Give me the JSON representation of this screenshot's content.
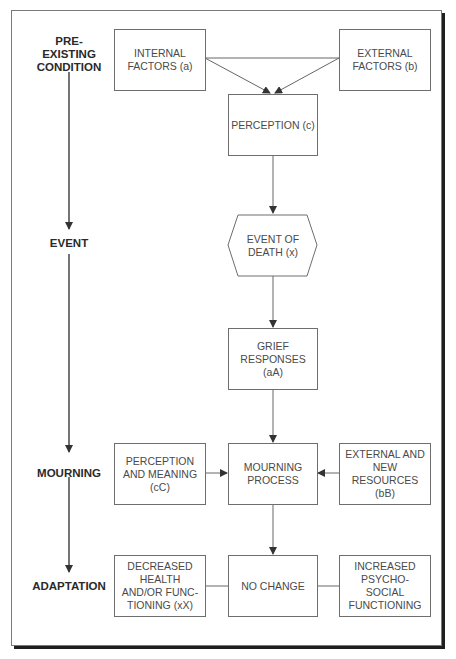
{
  "stages": [
    {
      "id": "pre-existing-condition",
      "label": "PRE-\nEXISTING\nCONDITION"
    },
    {
      "id": "event",
      "label": "EVENT"
    },
    {
      "id": "mourning",
      "label": "MOURNING"
    },
    {
      "id": "adaptation",
      "label": "ADAPTATION"
    }
  ],
  "nodes": {
    "internal_factors": "INTERNAL\nFACTORS (a)",
    "external_factors": "EXTERNAL\nFACTORS (b)",
    "perception": "PERCEPTION (c)",
    "event_of_death": "EVENT OF\nDEATH (x)",
    "grief_responses": "GRIEF\nRESPONSES\n(aA)",
    "perception_and_meaning": "PERCEPTION\nAND MEANING\n(cC)",
    "mourning_process": "MOURNING\nPROCESS",
    "external_and_new_resources": "EXTERNAL AND\nNEW\nRESOURCES\n(bB)",
    "decreased_health": "DECREASED\nHEALTH\nAND/OR FUNC-\nTIONING (xX)",
    "no_change": "NO CHANGE",
    "increased_psychosocial": "INCREASED\nPSYCHO-\nSOCIAL\nFUNCTIONING"
  },
  "edges": [
    {
      "from": "internal_factors",
      "to": "perception"
    },
    {
      "from": "external_factors",
      "to": "perception"
    },
    {
      "from": "internal_factors",
      "to": "external_factors",
      "style": "line"
    },
    {
      "from": "perception",
      "to": "event_of_death"
    },
    {
      "from": "event_of_death",
      "to": "grief_responses"
    },
    {
      "from": "grief_responses",
      "to": "mourning_process"
    },
    {
      "from": "perception_and_meaning",
      "to": "mourning_process"
    },
    {
      "from": "external_and_new_resources",
      "to": "mourning_process"
    },
    {
      "from": "mourning_process",
      "to": "no_change"
    },
    {
      "from": "decreased_health",
      "to": "no_change",
      "style": "line"
    },
    {
      "from": "no_change",
      "to": "increased_psychosocial",
      "style": "line"
    }
  ],
  "colors": {
    "line": "#555555",
    "text": "#4a4a4a",
    "stage_text": "#2a2a2a",
    "frame_shadow": "#1f1f1f"
  }
}
